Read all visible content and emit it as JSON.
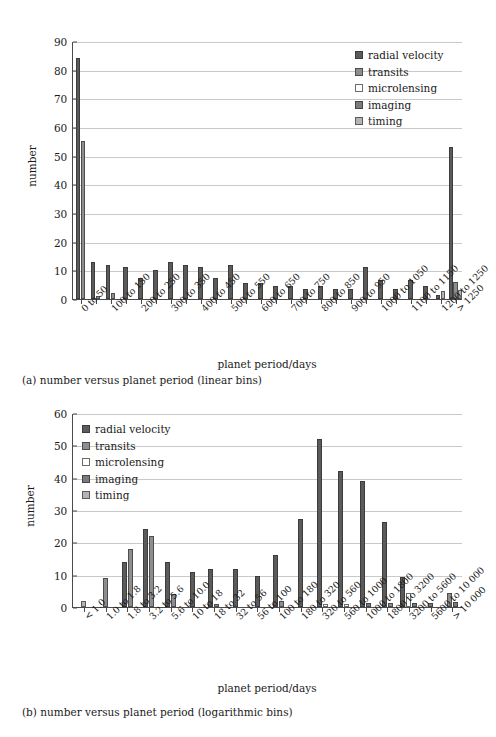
{
  "figure": {
    "captions": {
      "a": "(a) number versus planet period (linear bins)",
      "b": "(b) number versus planet period (logarithmic bins)"
    }
  },
  "legend": {
    "series": [
      {
        "key": "radial_velocity",
        "label": "radial velocity",
        "color": "#5b5b5b"
      },
      {
        "key": "transits",
        "label": "transits",
        "color": "#8e8e8e"
      },
      {
        "key": "microlensing",
        "label": "microlensing",
        "color": "#ffffff"
      },
      {
        "key": "imaging",
        "label": "imaging",
        "color": "#7b7b7b"
      },
      {
        "key": "timing",
        "label": "timing",
        "color": "#b4b4b4"
      }
    ]
  },
  "chart_data": [
    {
      "id": "linear",
      "type": "bar",
      "title": "",
      "xlabel": "planet period/days",
      "ylabel": "number",
      "ylim": [
        0,
        90
      ],
      "yticks": [
        0,
        10,
        20,
        30,
        40,
        50,
        60,
        70,
        80,
        90
      ],
      "grid": true,
      "legend_position": "top-right",
      "categories": [
        "0 to 50",
        "50 to 100",
        "100 to 150",
        "150 to 200",
        "200 to 250",
        "250 to 300",
        "300 to 350",
        "350 to 400",
        "400 to 450",
        "450 to 500",
        "500 to 550",
        "550 to 600",
        "600 to 650",
        "650 to 700",
        "700 to 750",
        "750 to 800",
        "800 to 850",
        "850 to 900",
        "900 to 950",
        "950 to 1000",
        "1000 to 1050",
        "1050 to 1100",
        "1100 to 1150",
        "1150 to 1200",
        "1200 to 1250",
        "> 1250"
      ],
      "tick_labels": [
        "0 to 50",
        "",
        "100 to 150",
        "",
        "200 to 250",
        "",
        "300 to 350",
        "",
        "400 to 450",
        "",
        "500 to 550",
        "",
        "600 to 650",
        "",
        "700 to 750",
        "",
        "800 to 850",
        "",
        "900 to 950",
        "",
        "1000 to 1050",
        "",
        "1100 to 1150",
        "",
        "1200 to 1250",
        "> 1250"
      ],
      "series": [
        {
          "name": "radial velocity",
          "values": [
            84,
            13,
            12,
            11,
            7.5,
            10,
            13,
            12,
            11,
            7.5,
            12,
            5.5,
            5.5,
            4.5,
            4.5,
            3.5,
            4.5,
            3.5,
            3.5,
            11,
            6.5,
            3.5,
            6.5,
            4.5,
            1.5,
            53
          ]
        },
        {
          "name": "transits",
          "values": [
            55,
            1.2,
            2.2,
            0,
            0,
            0,
            0,
            0,
            0,
            0,
            0,
            0,
            0,
            0,
            0,
            0,
            0,
            0,
            0,
            0,
            0,
            0,
            0,
            0,
            0,
            6
          ]
        },
        {
          "name": "microlensing",
          "values": [
            0,
            0,
            0,
            0,
            0,
            0,
            0,
            0,
            0,
            0,
            0,
            0,
            0,
            0,
            0,
            0,
            0,
            0,
            0,
            0,
            0,
            0,
            0,
            0,
            0,
            0
          ]
        },
        {
          "name": "imaging",
          "values": [
            0,
            0,
            0,
            0,
            0,
            0,
            0,
            0,
            0,
            0,
            0,
            0,
            0,
            0,
            0,
            0,
            0,
            0,
            0,
            0,
            0,
            0,
            0,
            0,
            0,
            0
          ]
        },
        {
          "name": "timing",
          "values": [
            0,
            0,
            0,
            0,
            0,
            0,
            0,
            0,
            0,
            0,
            0,
            0,
            0,
            0,
            0,
            0,
            0,
            0,
            0,
            0,
            0,
            0,
            0,
            0,
            2.8,
            3
          ]
        }
      ]
    },
    {
      "id": "log",
      "type": "bar",
      "title": "",
      "xlabel": "planet period/days",
      "ylabel": "number",
      "ylim": [
        0,
        60
      ],
      "yticks": [
        0,
        10,
        20,
        30,
        40,
        50,
        60
      ],
      "grid": true,
      "legend_position": "top-left",
      "categories": [
        "< 1.0",
        "1.0 to 1.8",
        "1.8 to 3.2",
        "3.2 to 5.6",
        "5.6 to 10.0",
        "10 to 18",
        "18 to 32",
        "32 to 56",
        "56 to 100",
        "100 to 180",
        "180 to 320",
        "320 to 560",
        "560 to 1000",
        "1000 to 1800",
        "1800 to 3200",
        "3200 to 5600",
        "5600 to 10000",
        "> 10000"
      ],
      "tick_labels": [
        "< 1.0",
        "1.0 to 1.8",
        "1.8 to 3.2",
        "3.2 to 5.6",
        "5.6 to 10.0",
        "10 to 18",
        "18 to 32",
        "32 to 56",
        "56 to 100",
        "100 to 180",
        "180 to 320",
        "320 to 560",
        "560 to 1000",
        "1000 to 1800",
        "1800 to 3200",
        "3200 to 5600",
        "5600 to 10 000",
        "> 10 000"
      ],
      "series": [
        {
          "name": "radial velocity",
          "values": [
            0,
            0,
            14,
            24,
            14,
            10.7,
            11.8,
            11.8,
            9.7,
            16,
            27.3,
            52,
            42,
            39,
            26.3,
            9.2,
            0,
            0
          ]
        },
        {
          "name": "transits",
          "values": [
            0,
            9,
            18,
            22,
            4,
            0,
            1,
            0,
            0,
            2,
            0,
            0,
            0,
            0,
            1.2,
            0,
            0,
            4.2
          ]
        },
        {
          "name": "microlensing",
          "values": [
            0,
            0,
            0,
            0,
            0,
            0,
            0,
            0,
            0,
            0,
            0,
            0.9,
            0.8,
            0,
            0,
            4.2,
            0,
            0
          ]
        },
        {
          "name": "imaging",
          "values": [
            0,
            0,
            0,
            0,
            0,
            0,
            0,
            0,
            0,
            0,
            0,
            0,
            0,
            1.1,
            0,
            1.1,
            1.1,
            1.4
          ]
        },
        {
          "name": "timing",
          "values": [
            1.8,
            0,
            0,
            0,
            0,
            0,
            0,
            0,
            0,
            0,
            0,
            0,
            0,
            0,
            0,
            0,
            0,
            0
          ]
        }
      ]
    }
  ]
}
